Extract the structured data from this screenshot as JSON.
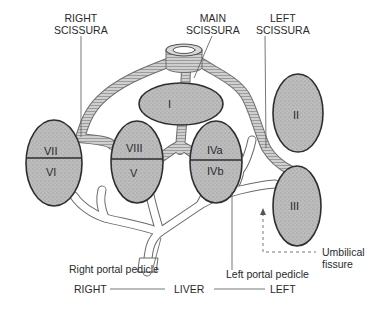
{
  "diagram": {
    "labels": {
      "right_scissura": [
        "RIGHT",
        "SCISSURA"
      ],
      "main_scissura": [
        "MAIN",
        "SCISSURA"
      ],
      "left_scissura": [
        "LEFT",
        "SCISSURA"
      ],
      "right_portal_pedicle": "Right portal pedicle",
      "left_portal_pedicle": "Left portal pedicle",
      "umbilical_fissure": [
        "Umbilical",
        "fissure"
      ],
      "axis_right": "RIGHT",
      "axis_center": "LIVER",
      "axis_left": "LEFT"
    },
    "segments": [
      {
        "id": "I",
        "label": "I"
      },
      {
        "id": "II",
        "label": "II"
      },
      {
        "id": "III",
        "label": "III"
      },
      {
        "id": "IVa",
        "label": "IVa"
      },
      {
        "id": "IVb",
        "label": "IVb"
      },
      {
        "id": "V",
        "label": "V"
      },
      {
        "id": "VI",
        "label": "VI"
      },
      {
        "id": "VII",
        "label": "VII"
      },
      {
        "id": "VIII",
        "label": "VIII"
      }
    ],
    "colors": {
      "segment_fill": "#b9b9b9",
      "segment_stroke": "#2e2e2e",
      "hepatic_vein_fill": "#c9c9c9",
      "portal_fill": "#ffffff",
      "line": "#555555"
    }
  }
}
